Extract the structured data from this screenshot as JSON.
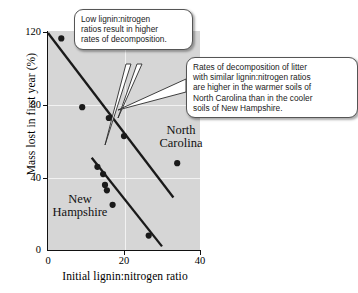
{
  "chart_data": {
    "type": "scatter",
    "title": "",
    "xlabel": "Initial lignin:nitrogen ratio",
    "ylabel": "Mass lost in first year (%)",
    "xlim": [
      0,
      40
    ],
    "ylim": [
      0,
      120
    ],
    "xticks": [
      "0",
      "20",
      "40"
    ],
    "yticks": [
      "0",
      "40",
      "80",
      "120"
    ],
    "grid": true,
    "legend_position": "in-plot-labels",
    "series": [
      {
        "name": "North Carolina",
        "points": [
          {
            "x": 3.5,
            "y": 117
          },
          {
            "x": 9.0,
            "y": 79
          },
          {
            "x": 16.0,
            "y": 73
          },
          {
            "x": 20.0,
            "y": 63
          },
          {
            "x": 34.0,
            "y": 48
          }
        ],
        "trendline": {
          "x1": 0.0,
          "y1": 120,
          "x2": 33.0,
          "y2": 29
        }
      },
      {
        "name": "New Hampshire",
        "points": [
          {
            "x": 13.0,
            "y": 46
          },
          {
            "x": 14.5,
            "y": 42
          },
          {
            "x": 15.0,
            "y": 36
          },
          {
            "x": 15.5,
            "y": 33
          },
          {
            "x": 17.0,
            "y": 25
          },
          {
            "x": 26.5,
            "y": 8
          }
        ],
        "trendline": {
          "x1": 11.5,
          "y1": 51,
          "x2": 30.0,
          "y2": 2
        }
      }
    ],
    "annotations": [
      {
        "id": "low-lignin",
        "text": "Low lignin:nitrogen ratios result in higher rates of decomposition."
      },
      {
        "id": "rates",
        "text": "Rates of decomposition of litter with similar lignin:nitrogen ratios are higher in the warmer soils of North Carolina than in the cooler soils of New Hampshire."
      }
    ]
  },
  "axes": {
    "y_title": "Mass lost in first year (%)",
    "x_title": "Initial lignin:nitrogen ratio",
    "y_tick_0": "0",
    "y_tick_40": "40",
    "y_tick_80": "80",
    "y_tick_120": "120",
    "x_tick_0": "0",
    "x_tick_20": "20",
    "x_tick_40": "40"
  },
  "labels": {
    "north_carolina": "North\nCarolina",
    "north_carolina_line1": "North",
    "north_carolina_line2": "Carolina",
    "new_hampshire_line1": "New",
    "new_hampshire_line2": "Hampshire"
  },
  "callouts": {
    "low_lignin_line1": "Low lignin:nitrogen",
    "low_lignin_line2": "ratios result in higher",
    "low_lignin_line3": "rates of decomposition.",
    "rates_line1": "Rates of decomposition of litter",
    "rates_line2": "with similar lignin:nitrogen ratios",
    "rates_line3": "are higher in the warmer soils of",
    "rates_line4": "North Carolina than in the cooler",
    "rates_line5": "soils of New Hampshire."
  },
  "colors": {
    "plot_background": "#d6d6d6",
    "gridline": "#f2f2f2",
    "marker": "#1a1a1a",
    "trendline": "#1a1a1a",
    "callout_border": "#555555",
    "callout_background": "#ffffff"
  },
  "caption": ""
}
